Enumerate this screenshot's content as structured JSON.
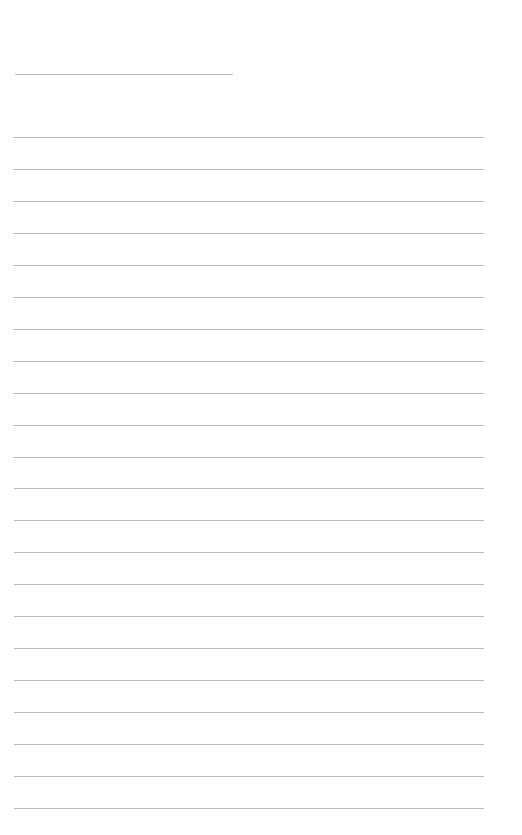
{
  "page": {
    "type": "lined-writing-sheet",
    "background_color": "#ffffff",
    "rule_color": "#b9b9b9"
  },
  "title_line": {
    "top": 74,
    "left": 15,
    "width": 218,
    "text": ""
  },
  "lines": {
    "count": 22,
    "first_top": 137,
    "spacing": 31.95,
    "left": 14,
    "width": 470,
    "entries": [
      "",
      "",
      "",
      "",
      "",
      "",
      "",
      "",
      "",
      "",
      "",
      "",
      "",
      "",
      "",
      "",
      "",
      "",
      "",
      "",
      "",
      ""
    ]
  }
}
